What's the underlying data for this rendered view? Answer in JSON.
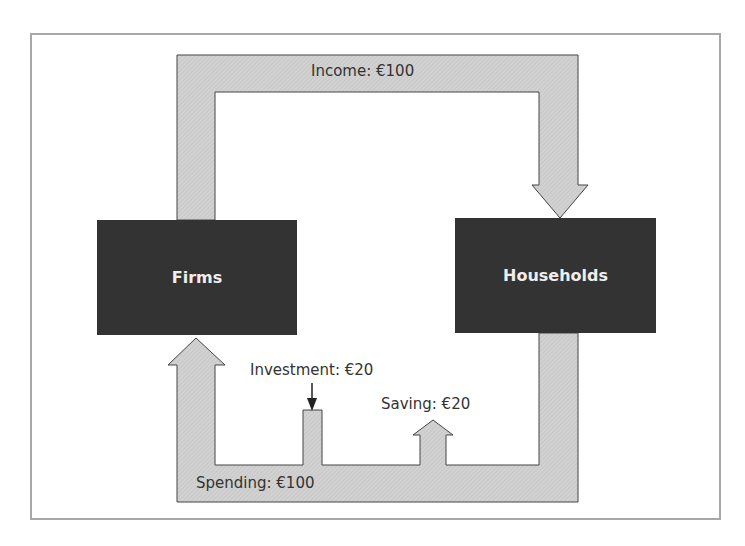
{
  "diagram": {
    "nodes": {
      "firms": "Firms",
      "households": "Households"
    },
    "flows": {
      "income": "Income: €100",
      "spending": "Spending: €100",
      "investment": "Investment: €20",
      "saving": "Saving: €20"
    },
    "colors": {
      "box_fill": "#333333",
      "box_text": "#eeeeee",
      "flow_fill": "#cfcfcf",
      "flow_stroke": "#444444",
      "frame": "#a8a8a8",
      "label_text": "#333333"
    }
  }
}
